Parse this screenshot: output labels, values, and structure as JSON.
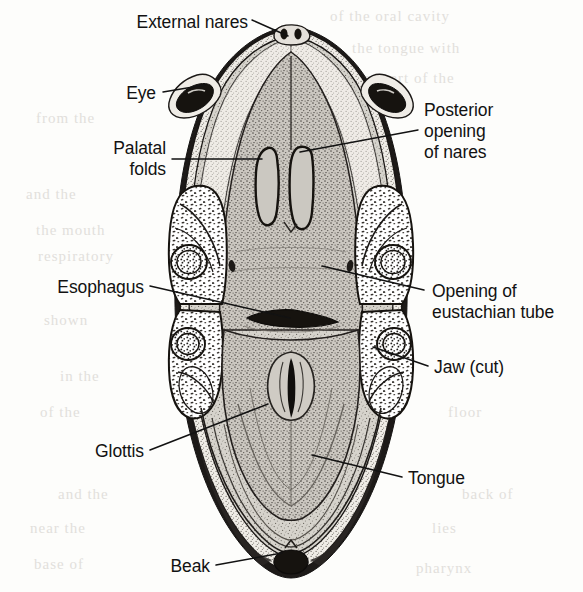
{
  "figure": {
    "style": "black-and-white stippled line engraving"
  },
  "colors": {
    "ink": "#121212",
    "paper": "#fdfdfb",
    "tissue_light": "#d8d5cf",
    "tissue_mid": "#c2beb6",
    "tissue_dark": "#8d8880",
    "beak_dark": "#2a2724",
    "jaw_fill": "#ffffff",
    "ghost_text": "#e2e0dc"
  },
  "labels": [
    {
      "id": "external-nares",
      "text": "External nares",
      "align": "right",
      "x": 88,
      "y": 12,
      "width": 160,
      "leader": {
        "x1": 252,
        "y1": 20,
        "x2": 288,
        "y2": 36
      }
    },
    {
      "id": "eye",
      "text": "Eye",
      "align": "right",
      "x": 96,
      "y": 83,
      "width": 60,
      "leader": {
        "x1": 163,
        "y1": 92,
        "x2": 205,
        "y2": 85
      }
    },
    {
      "id": "palatal-folds",
      "text": "Palatal\nfolds",
      "align": "right",
      "x": 68,
      "y": 138,
      "width": 98,
      "leader": {
        "x1": 172,
        "y1": 159,
        "x2": 262,
        "y2": 159
      }
    },
    {
      "id": "esophagus",
      "text": "Esophagus",
      "align": "right",
      "x": 28,
      "y": 277,
      "width": 116,
      "leader": {
        "x1": 150,
        "y1": 286,
        "x2": 290,
        "y2": 318
      }
    },
    {
      "id": "glottis",
      "text": "Glottis",
      "align": "right",
      "x": 68,
      "y": 441,
      "width": 76,
      "leader": {
        "x1": 150,
        "y1": 450,
        "x2": 268,
        "y2": 404
      }
    },
    {
      "id": "beak",
      "text": "Beak",
      "align": "right",
      "x": 148,
      "y": 556,
      "width": 62,
      "leader": {
        "x1": 216,
        "y1": 565,
        "x2": 282,
        "y2": 553
      }
    },
    {
      "id": "posterior-opening-of-nares",
      "text": "Posterior\nopening\nof nares",
      "align": "left",
      "x": 424,
      "y": 100,
      "width": 150,
      "leader": {
        "x1": 418,
        "y1": 130,
        "x2": 300,
        "y2": 152
      }
    },
    {
      "id": "opening-of-eustachian-tube",
      "text": "Opening of\neustachian tube",
      "align": "left",
      "x": 432,
      "y": 281,
      "width": 150,
      "leader": {
        "x1": 424,
        "y1": 290,
        "x2": 322,
        "y2": 266
      }
    },
    {
      "id": "jaw-cut",
      "text": "Jaw (cut)",
      "align": "left",
      "x": 434,
      "y": 357,
      "width": 110,
      "leader": {
        "x1": 428,
        "y1": 366,
        "x2": 373,
        "y2": 347
      }
    },
    {
      "id": "tongue",
      "text": "Tongue",
      "align": "left",
      "x": 408,
      "y": 468,
      "width": 100,
      "leader": {
        "x1": 402,
        "y1": 477,
        "x2": 312,
        "y2": 455
      }
    }
  ],
  "structures": [
    {
      "id": "external-nares",
      "name": "External nares"
    },
    {
      "id": "eye",
      "name": "Eye"
    },
    {
      "id": "palatal-folds",
      "name": "Palatal folds"
    },
    {
      "id": "posterior-opening-of-nares",
      "name": "Posterior opening of nares"
    },
    {
      "id": "opening-of-eustachian-tube",
      "name": "Opening of eustachian tube"
    },
    {
      "id": "jaw-cut",
      "name": "Jaw (cut)"
    },
    {
      "id": "esophagus",
      "name": "Esophagus"
    },
    {
      "id": "glottis",
      "name": "Glottis"
    },
    {
      "id": "tongue",
      "name": "Tongue"
    },
    {
      "id": "beak",
      "name": "Beak"
    }
  ],
  "bleed_through": [
    {
      "text": "of the oral cavity",
      "x": 330,
      "y": 8
    },
    {
      "text": "the tongue with",
      "x": 352,
      "y": 40
    },
    {
      "text": "upper part of the",
      "x": 338,
      "y": 70
    },
    {
      "text": "that the",
      "x": 320,
      "y": 104
    },
    {
      "text": "from the",
      "x": 36,
      "y": 110
    },
    {
      "text": "and the",
      "x": 26,
      "y": 186
    },
    {
      "text": "reveals",
      "x": 342,
      "y": 200
    },
    {
      "text": "the mouth",
      "x": 36,
      "y": 222
    },
    {
      "text": "respiratory",
      "x": 38,
      "y": 248
    },
    {
      "text": "the opening",
      "x": 332,
      "y": 238
    },
    {
      "text": "is the",
      "x": 352,
      "y": 272
    },
    {
      "text": "shown",
      "x": 44,
      "y": 312
    },
    {
      "text": "in the",
      "x": 60,
      "y": 368
    },
    {
      "text": "tube",
      "x": 368,
      "y": 330
    },
    {
      "text": "of the",
      "x": 40,
      "y": 404
    },
    {
      "text": "floor",
      "x": 448,
      "y": 404
    },
    {
      "text": "and the",
      "x": 58,
      "y": 486
    },
    {
      "text": "back of",
      "x": 462,
      "y": 486
    },
    {
      "text": "near the",
      "x": 30,
      "y": 520
    },
    {
      "text": "lies",
      "x": 432,
      "y": 520
    },
    {
      "text": "base of",
      "x": 34,
      "y": 556
    },
    {
      "text": "pharynx",
      "x": 416,
      "y": 560
    }
  ]
}
